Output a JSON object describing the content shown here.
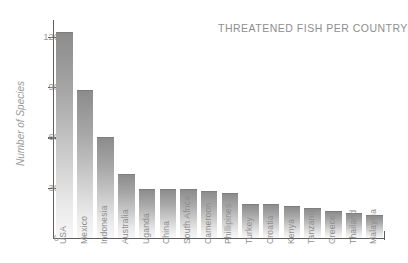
{
  "chart_data": {
    "type": "bar",
    "title": "THREATENED FISH PER COUNTRY",
    "xlabel": "",
    "ylabel": "Number of Species",
    "ylim": [
      0,
      130
    ],
    "yticks": [
      0,
      30,
      60,
      90,
      120
    ],
    "grid": false,
    "legend": null,
    "categories": [
      "USA",
      "Mexico",
      "Indonesia",
      "Australia",
      "Uganda",
      "China",
      "South Africa",
      "Cameroon",
      "Phillipines",
      "Turkey",
      "Croatia",
      "Kenya",
      "Tanzania",
      "Greece",
      "Thailand",
      "Malaysia"
    ],
    "values": [
      123,
      88,
      60,
      38,
      29,
      29,
      29,
      28,
      27,
      20,
      20,
      19,
      18,
      16,
      15,
      14
    ],
    "bar_color": "#a8a8a8",
    "axis_color": "#5e5e5e",
    "text_color": "#8e8e8e"
  }
}
